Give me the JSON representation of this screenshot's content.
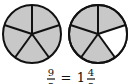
{
  "diagram": {
    "type": "fraction-pie",
    "slices_per_circle": 5,
    "circles": [
      {
        "shaded": 5,
        "unshaded": 0
      },
      {
        "shaded": 4,
        "unshaded": 1
      }
    ],
    "colors": {
      "shaded": "#c8c8c8",
      "unshaded": "#ffffff",
      "stroke": "#111111"
    }
  },
  "equation": {
    "improper_numerator": "9",
    "improper_denominator": "5",
    "equals": "=",
    "whole": "1",
    "mixed_numerator": "4",
    "mixed_denominator": "5"
  }
}
